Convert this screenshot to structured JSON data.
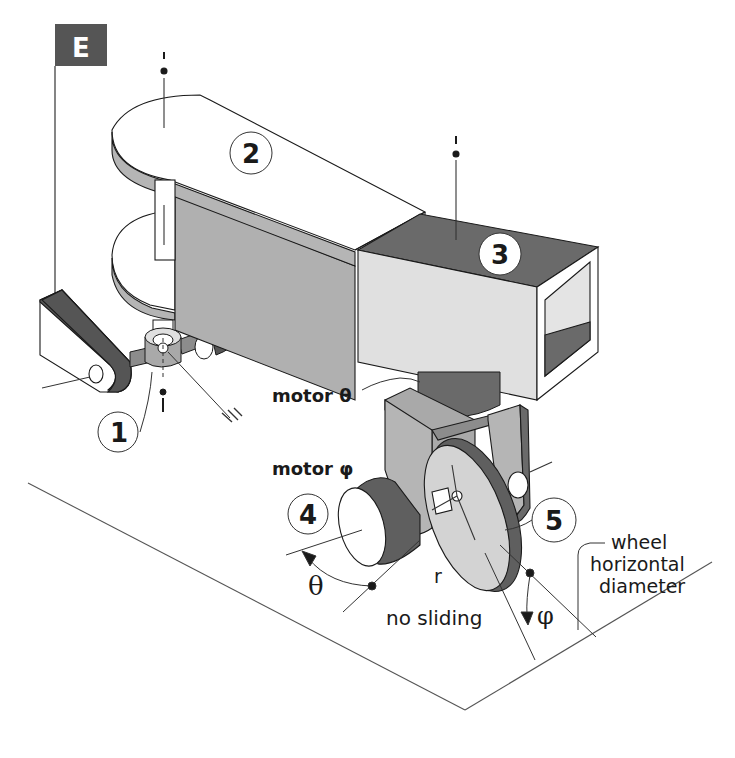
{
  "diagram": {
    "type": "isometric mechanical diagram",
    "frame_tag": "E",
    "parts": [
      {
        "id": "1",
        "label": "1",
        "description": "ball/pivot joint on horizontal axle"
      },
      {
        "id": "2",
        "label": "2",
        "description": "clevis body (forked arm)"
      },
      {
        "id": "3",
        "label": "3",
        "description": "hollow square tube"
      },
      {
        "id": "4",
        "label": "4",
        "description": "motor phi (wheel drive motor)"
      },
      {
        "id": "5",
        "label": "5",
        "description": "wheel fork / caster bracket"
      }
    ],
    "annotations": {
      "motor_theta": "motor θ",
      "motor_phi": "motor φ",
      "theta": "θ",
      "phi": "φ",
      "radius": "r",
      "no_sliding": "no sliding",
      "wheel_line1": "wheel",
      "wheel_line2": "horizontal",
      "wheel_line3": "diameter"
    },
    "colors": {
      "background": "#ffffff",
      "line": "#1a1a1a",
      "dark_fill": "#5f5f5f",
      "mid_fill": "#a9a9a9",
      "light_fill": "#d3d3d3",
      "very_light_fill": "#e4e4e4",
      "tag_fill": "#555555",
      "tag_text": "#ffffff"
    }
  }
}
